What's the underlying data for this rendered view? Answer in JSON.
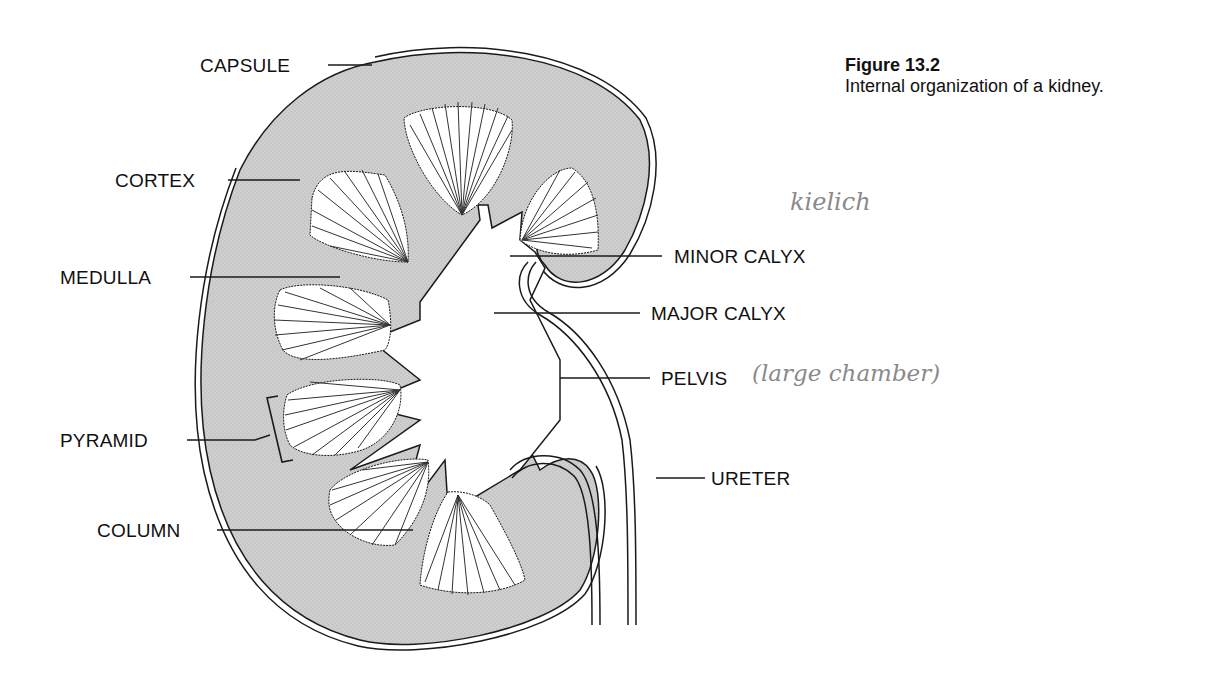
{
  "figure": {
    "number": "Figure 13.2",
    "caption": "Internal organization of a kidney."
  },
  "labels": {
    "capsule": "CAPSULE",
    "cortex": "CORTEX",
    "medulla": "MEDULLA",
    "pyramid": "PYRAMID",
    "column": "COLUMN",
    "minor_calyx": "MINOR CALYX",
    "major_calyx": "MAJOR CALYX",
    "pelvis": "PELVIS",
    "ureter": "URETER"
  },
  "handwritten_notes": {
    "kidney_word": "kielich",
    "pelvis_note": "(large chamber)"
  },
  "colors": {
    "cortex_fill": "#c9c9c9",
    "outline": "#1a1a1a",
    "handwriting": "#8a8a8a"
  }
}
